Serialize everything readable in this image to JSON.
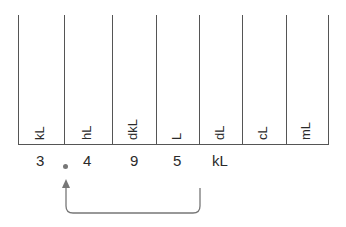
{
  "chart": {
    "units": [
      "kL",
      "hL",
      "dkL",
      "L",
      "dL",
      "cL",
      "mL"
    ],
    "digits": [
      "3",
      "4",
      "9",
      "5"
    ],
    "unit_suffix": "kL",
    "decimal_point": "."
  },
  "colors": {
    "line": "#555555",
    "text": "#2a2a2a",
    "arrow": "#777777"
  }
}
